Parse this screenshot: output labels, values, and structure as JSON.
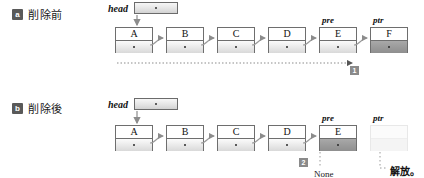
{
  "diagram": {
    "rows": [
      {
        "badge": "a",
        "label": "削除前",
        "head_label": "head",
        "nodes": [
          {
            "value": "A",
            "var": "",
            "dark": false,
            "empty": false
          },
          {
            "value": "B",
            "var": "",
            "dark": false,
            "empty": false
          },
          {
            "value": "C",
            "var": "",
            "dark": false,
            "empty": false
          },
          {
            "value": "D",
            "var": "",
            "dark": false,
            "empty": false
          },
          {
            "value": "E",
            "var": "pre",
            "dark": false,
            "empty": false
          },
          {
            "value": "F",
            "var": "ptr",
            "dark": true,
            "empty": false
          }
        ],
        "step_badge": "1"
      },
      {
        "badge": "b",
        "label": "削除後",
        "head_label": "head",
        "nodes": [
          {
            "value": "A",
            "var": "",
            "dark": false,
            "empty": false
          },
          {
            "value": "B",
            "var": "",
            "dark": false,
            "empty": false
          },
          {
            "value": "C",
            "var": "",
            "dark": false,
            "empty": false
          },
          {
            "value": "D",
            "var": "",
            "dark": false,
            "empty": false
          },
          {
            "value": "E",
            "var": "pre",
            "dark": true,
            "empty": false
          },
          {
            "value": "",
            "var": "ptr",
            "dark": false,
            "empty": true
          }
        ],
        "step_badge": "2",
        "none_text": "None",
        "free_text": "解放。"
      }
    ],
    "colors": {
      "node_border": "#6e6e6e",
      "node_dark_fill": "#9b9b9b",
      "badge_fill": "#595959",
      "arrow": "#8c8c8c",
      "text": "#111111"
    }
  }
}
